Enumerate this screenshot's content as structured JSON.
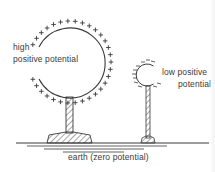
{
  "diagram": {
    "type": "electrostatics-illustration",
    "labels": {
      "high_line1": "high",
      "high_line2": "positive potential",
      "low_line1": "low positive",
      "low_line2": "potential",
      "earth": "earth (zero potential)"
    },
    "objects": [
      {
        "name": "large-sphere",
        "charge_sign": "+",
        "potential": "high positive",
        "charge_density": "dense"
      },
      {
        "name": "small-sphere",
        "charge_sign": "-like dashes",
        "potential": "low positive",
        "charge_density": "sparse"
      }
    ],
    "colors": {
      "line": "#3a3a3a",
      "background": "#ffffff"
    }
  }
}
